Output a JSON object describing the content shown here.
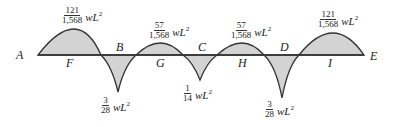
{
  "diagram": {
    "type": "bending-moment-diagram",
    "fill_color": "#d3d3d3",
    "stroke_color": "#333333",
    "points": {
      "A": "A",
      "B": "B",
      "C": "C",
      "D": "D",
      "E": "E",
      "F": "F",
      "G": "G",
      "H": "H",
      "I": "I"
    },
    "moments": {
      "F": {
        "num": "121",
        "den": "1,568",
        "unit": "wL",
        "exp": "2"
      },
      "B": {
        "num": "3",
        "den": "28",
        "unit": "wL",
        "exp": "2"
      },
      "G": {
        "num": "57",
        "den": "1,568",
        "unit": "wL",
        "exp": "2"
      },
      "C": {
        "num": "1",
        "den": "14",
        "unit": "wL",
        "exp": "2"
      },
      "H": {
        "num": "57",
        "den": "1,568",
        "unit": "wL",
        "exp": "2"
      },
      "D": {
        "num": "3",
        "den": "28",
        "unit": "wL",
        "exp": "2"
      },
      "I": {
        "num": "121",
        "den": "1,568",
        "unit": "wL",
        "exp": "2"
      }
    }
  }
}
